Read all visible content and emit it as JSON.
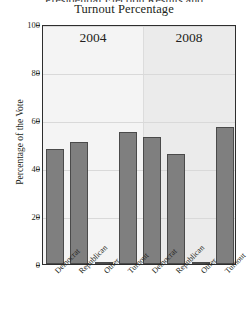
{
  "figure": {
    "title": "Turnout Percentage",
    "title_clipped_above": "Presidential Election Results and",
    "ylabel": "Percentage of the Vote",
    "bar_color": "#7f7f7f",
    "bar_edge_color": "#4a4a4a",
    "panel_bg_2004": "#f4f4f4",
    "panel_bg_2008": "#ebebeb",
    "frame_color": "#2e2e2e",
    "grid_color": "#d9d9d9"
  },
  "chart_data": {
    "type": "bar",
    "title": "Turnout Percentage",
    "xlabel": "",
    "ylabel": "Percentage of the Vote",
    "ylim": [
      0,
      100
    ],
    "yticks": [
      0,
      20,
      40,
      60,
      80,
      100
    ],
    "grid": true,
    "legend": "none",
    "panels": [
      {
        "label": "2004",
        "categories": [
          "Democrat",
          "Republican",
          "Other",
          "Turnout"
        ],
        "values": [
          48,
          51,
          1,
          55
        ]
      },
      {
        "label": "2008",
        "categories": [
          "Democrat",
          "Republican",
          "Other",
          "Turnout"
        ],
        "values": [
          53,
          46,
          1,
          57
        ]
      }
    ]
  }
}
